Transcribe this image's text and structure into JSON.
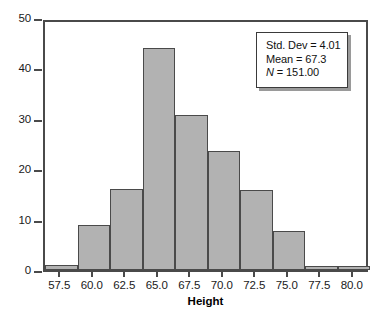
{
  "chart_data": {
    "type": "bar",
    "title": "",
    "subtitle": "",
    "xlabel": "Height",
    "ylabel": "",
    "categories": [
      "57.5",
      "60.0",
      "62.5",
      "65.0",
      "67.5",
      "70.0",
      "72.5",
      "75.0",
      "77.5",
      "80.0"
    ],
    "values": [
      1,
      9,
      16,
      44,
      30.7,
      23.6,
      15.8,
      7.8,
      0.8,
      0.8
    ],
    "xlim": [
      56.25,
      81.25
    ],
    "ylim": [
      0,
      50
    ],
    "x_tick_labels": [
      "57.5",
      "60.0",
      "62.5",
      "65.0",
      "67.5",
      "70.0",
      "72.5",
      "75.0",
      "77.5",
      "80.0"
    ],
    "y_tick_labels": [
      "0",
      "10",
      "20",
      "30",
      "40",
      "50"
    ],
    "y_ticks": [
      0,
      10,
      20,
      30,
      40,
      50
    ],
    "grid": false,
    "legend_position": "top-right",
    "bin_width": 2.5,
    "bar_color": "#b2b2b2",
    "bar_edge_color": "#4a4a4a",
    "axis_color": "#4a4a4a",
    "background_color": "#ffffff"
  },
  "annotations": {
    "stats_box": {
      "std_dev_label": "Std. Dev = 4.01",
      "mean_label": "Mean = 67.3",
      "n_symbol": "N",
      "n_value": " = 151.00"
    }
  }
}
